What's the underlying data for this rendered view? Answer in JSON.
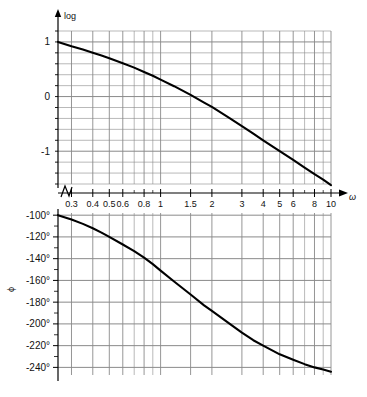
{
  "figure": {
    "kind": "bode-plot",
    "panels": [
      {
        "id": "magnitude",
        "y_axis_label": "log",
        "y_ticks": [
          "1",
          "0",
          "-1"
        ],
        "y_tick_values": [
          1,
          0,
          -1
        ],
        "y_range": [
          -1.6,
          1.2
        ],
        "minor_step": 0.2
      },
      {
        "id": "phase",
        "y_axis_label": "ϕ",
        "y_ticks": [
          "-100°",
          "-120°",
          "-140°",
          "-160°",
          "-180°",
          "-200°",
          "-220°",
          "-240°"
        ],
        "y_tick_values": [
          -100,
          -120,
          -140,
          -160,
          -180,
          -200,
          -220,
          -240
        ],
        "y_range": [
          -247,
          -98
        ],
        "minor_step": 10
      }
    ],
    "x_axis_label": "ω",
    "x_scale": "log",
    "x_range": [
      0.25,
      10
    ],
    "x_tick_labels": [
      "0.3",
      "0.4",
      "0.5",
      "0.6",
      "0.8",
      "1",
      "1.5",
      "2",
      "3",
      "4",
      "5",
      "6",
      "8",
      "10"
    ],
    "x_tick_values": [
      0.3,
      0.4,
      0.5,
      0.6,
      0.8,
      1,
      1.5,
      2,
      3,
      4,
      5,
      6,
      8,
      10
    ],
    "x_gridline_values": [
      0.3,
      0.4,
      0.5,
      0.6,
      0.7,
      0.8,
      0.9,
      1,
      1.5,
      2,
      3,
      4,
      5,
      6,
      7,
      8,
      9,
      10
    ],
    "x_major_gridline_values": [
      0.3,
      0.4,
      0.5,
      0.6,
      0.8,
      1,
      1.5,
      2,
      3,
      4,
      5,
      6,
      8,
      10
    ],
    "axis_break_symbol": "zigzag",
    "colors": {
      "curve": "#000000",
      "grid": "#8a8a8a",
      "axis": "#000000",
      "background": "#ffffff",
      "text": "#111111"
    }
  },
  "chart_data": [
    {
      "type": "line",
      "id": "magnitude",
      "title": "",
      "xlabel": "ω",
      "ylabel": "log",
      "xscale": "log",
      "xlim": [
        0.25,
        10
      ],
      "ylim": [
        -1.6,
        1.2
      ],
      "grid": true,
      "legend": "none",
      "xticks": [
        0.3,
        0.4,
        0.5,
        0.6,
        0.8,
        1,
        1.5,
        2,
        3,
        4,
        5,
        6,
        8,
        10
      ],
      "xticklabels": [
        "0.3",
        "0.4",
        "0.5",
        "0.6",
        "0.8",
        "1",
        "1.5",
        "2",
        "3",
        "4",
        "5",
        "6",
        "8",
        "10"
      ],
      "yticks": [
        1,
        0,
        -1
      ],
      "yticklabels": [
        "1",
        "0",
        "-1"
      ],
      "x": [
        0.25,
        0.3,
        0.35,
        0.4,
        0.45,
        0.5,
        0.6,
        0.7,
        0.8,
        0.9,
        1.0,
        1.2,
        1.5,
        1.8,
        2.0,
        2.5,
        3.0,
        3.5,
        4.0,
        5.0,
        6.0,
        7.0,
        8.0,
        9.0,
        10.0
      ],
      "y": [
        1.0,
        0.92,
        0.86,
        0.8,
        0.75,
        0.7,
        0.61,
        0.53,
        0.45,
        0.38,
        0.31,
        0.19,
        0.03,
        -0.11,
        -0.19,
        -0.38,
        -0.54,
        -0.68,
        -0.8,
        -1.0,
        -1.16,
        -1.3,
        -1.42,
        -1.52,
        -1.62
      ]
    },
    {
      "type": "line",
      "id": "phase",
      "title": "",
      "xlabel": "ω",
      "ylabel": "ϕ",
      "xscale": "log",
      "xlim": [
        0.25,
        10
      ],
      "ylim": [
        -247,
        -98
      ],
      "grid": true,
      "legend": "none",
      "xticks": [
        0.3,
        0.4,
        0.5,
        0.6,
        0.8,
        1,
        1.5,
        2,
        3,
        4,
        5,
        6,
        8,
        10
      ],
      "xticklabels": [
        "0.3",
        "0.4",
        "0.5",
        "0.6",
        "0.8",
        "1",
        "1.5",
        "2",
        "3",
        "4",
        "5",
        "6",
        "8",
        "10"
      ],
      "yticks": [
        -100,
        -120,
        -140,
        -160,
        -180,
        -200,
        -220,
        -240
      ],
      "yticklabels": [
        "-100°",
        "-120°",
        "-140°",
        "-160°",
        "-180°",
        "-200°",
        "-220°",
        "-240°"
      ],
      "x": [
        0.25,
        0.3,
        0.35,
        0.4,
        0.45,
        0.5,
        0.6,
        0.7,
        0.8,
        0.9,
        1.0,
        1.2,
        1.5,
        1.8,
        2.0,
        2.5,
        3.0,
        3.5,
        4.0,
        5.0,
        6.0,
        7.0,
        8.0,
        9.0,
        10.0
      ],
      "y": [
        -100,
        -104,
        -108,
        -112,
        -116,
        -120,
        -127,
        -133,
        -139,
        -145,
        -151,
        -161,
        -173,
        -183,
        -188,
        -199,
        -208,
        -215,
        -220,
        -228,
        -233,
        -237,
        -240,
        -242,
        -244
      ]
    }
  ]
}
